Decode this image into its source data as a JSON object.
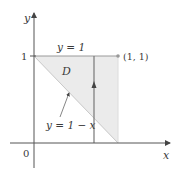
{
  "diagram": {
    "region_label": "D",
    "top_boundary_label": "y = 1",
    "diagonal_boundary_label": "y = 1 − x",
    "corner_point_label": "(1, 1)",
    "y_tick_label": "1",
    "origin_label": "0",
    "x_axis_label": "x",
    "y_axis_label": "y",
    "colors": {
      "region_fill": "#ebebeb",
      "axis": "#555555",
      "boundary": "#8a8a8a",
      "text": "#3a3a3a"
    }
  }
}
